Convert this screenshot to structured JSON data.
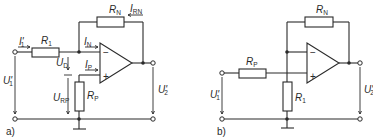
{
  "diagram": {
    "type": "op-amp circuit schematics",
    "panels": [
      {
        "caption": "a)",
        "description": "Inverting amplifier with bias-compensation resistor R_P",
        "components": {
          "R1": {
            "name": "R",
            "sub": "1"
          },
          "RN": {
            "name": "R",
            "sub": "N"
          },
          "RP": {
            "name": "R",
            "sub": "P"
          }
        },
        "labels": {
          "I1": {
            "name": "I",
            "sub": "1",
            "prime": "'"
          },
          "IN": {
            "name": "I",
            "sub": "N"
          },
          "IP": {
            "name": "I",
            "sub": "P"
          },
          "IRN": {
            "name": "I",
            "sub": "RN"
          },
          "UD": {
            "name": "U",
            "sub": "D"
          },
          "URP": {
            "name": "U",
            "sub": "RP"
          },
          "U1": {
            "name": "U",
            "sub": "1",
            "prime": "'"
          },
          "U2": {
            "name": "U",
            "sub": "2",
            "prime": "'"
          }
        },
        "opamp": {
          "minus": "−",
          "plus": "+"
        }
      },
      {
        "caption": "b)",
        "description": "Non-inverting amplifier with input resistor R_P",
        "components": {
          "RP": {
            "name": "R",
            "sub": "P"
          },
          "RN": {
            "name": "R",
            "sub": "N"
          },
          "R1": {
            "name": "R",
            "sub": "1"
          }
        },
        "labels": {
          "U1": {
            "name": "U",
            "sub": "1",
            "prime": "'"
          },
          "U2": {
            "name": "U",
            "sub": "2",
            "prime": "'"
          }
        },
        "opamp": {
          "minus": "−",
          "plus": "+"
        }
      }
    ]
  }
}
